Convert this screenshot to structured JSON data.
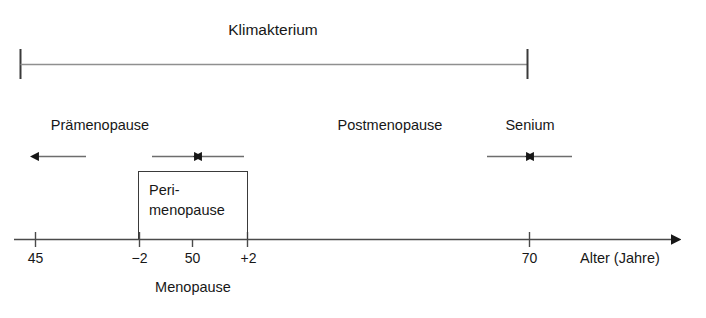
{
  "diagram": {
    "title": "Klimakterium",
    "phases": {
      "premenopause": "Prämenopause",
      "perimenopause_line1": "Peri-",
      "perimenopause_line2": "menopause",
      "postmenopause": "Postmenopause",
      "senium": "Senium"
    },
    "menopause_caption": "Menopause",
    "axis": {
      "title": "Alter (Jahre)",
      "ticks": [
        {
          "label": "45",
          "x": 35
        },
        {
          "label": "−2",
          "x": 139
        },
        {
          "label": "50",
          "x": 192
        },
        {
          "label": "+2",
          "x": 248
        },
        {
          "label": "70",
          "x": 529
        }
      ]
    },
    "colors": {
      "ink": "#171717",
      "line": "#4a4a4a",
      "rule": "#8a8a8a",
      "background": "#ffffff"
    }
  }
}
